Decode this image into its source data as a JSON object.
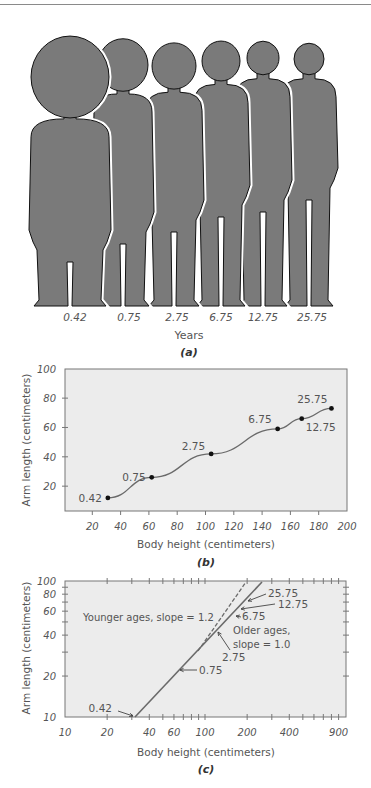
{
  "colors": {
    "silhouette_fill": "#7a7a7a",
    "silhouette_stroke": "#111111",
    "plot_bg": "#ececec",
    "axis": "#777777",
    "line": "#6a6a6a",
    "text": "#555555"
  },
  "panel_a": {
    "caption": "(a)",
    "xlabel": "Years",
    "ages": [
      "0.42",
      "0.75",
      "2.75",
      "6.75",
      "12.75",
      "25.75"
    ]
  },
  "panel_b": {
    "caption": "(b)",
    "xlabel": "Body height (centimeters)",
    "ylabel": "Arm length (centimeters)",
    "xticks": [
      "20",
      "40",
      "60",
      "80",
      "100",
      "120",
      "140",
      "160",
      "180",
      "200"
    ],
    "yticks": [
      "20",
      "40",
      "60",
      "80",
      "100"
    ],
    "point_labels": [
      "0.42",
      "0.75",
      "2.75",
      "6.75",
      "12.75",
      "25.75"
    ]
  },
  "panel_c": {
    "caption": "(c)",
    "xlabel": "Body height (centimeters)",
    "ylabel": "Arm length (centimeters)",
    "xticks": [
      "10",
      "20",
      "40",
      "60",
      "100",
      "200",
      "400",
      "900"
    ],
    "yticks": [
      "10",
      "20",
      "40",
      "60",
      "80",
      "100"
    ],
    "annotation_younger": "Younger ages, slope = 1.2",
    "annotation_older_1": "Older ages,",
    "annotation_older_2": "slope = 1.0",
    "point_labels": [
      "0.42",
      "0.75",
      "2.75",
      "6.75",
      "12.75",
      "25.75"
    ]
  },
  "chart_data": [
    {
      "type": "line",
      "title": "(b)",
      "xlabel": "Body height (centimeters)",
      "ylabel": "Arm length (centimeters)",
      "xlim": [
        0,
        200
      ],
      "ylim": [
        0,
        100
      ],
      "grid": false,
      "series": [
        {
          "name": "Age (years)",
          "labels": [
            "0.42",
            "0.75",
            "2.75",
            "6.75",
            "12.75",
            "25.75"
          ],
          "x": [
            31,
            62,
            104,
            151,
            168,
            189
          ],
          "y": [
            12,
            26,
            42,
            59,
            66,
            73
          ]
        }
      ]
    },
    {
      "type": "line",
      "title": "(c)",
      "xlabel": "Body height (centimeters)",
      "ylabel": "Arm length (centimeters)",
      "xscale": "log",
      "yscale": "log",
      "xlim": [
        10,
        1000
      ],
      "ylim": [
        10,
        100
      ],
      "grid": false,
      "annotations": [
        "Younger ages, slope = 1.2",
        "Older ages, slope = 1.0"
      ],
      "series": [
        {
          "name": "Observed (solid)",
          "labels": [
            "0.42",
            "0.75",
            "2.75",
            "6.75",
            "12.75",
            "25.75"
          ],
          "x": [
            31,
            62,
            104,
            151,
            168,
            189
          ],
          "y": [
            10,
            26,
            42,
            59,
            66,
            73
          ]
        },
        {
          "name": "Younger ages extrapolation, slope = 1.2 (dashed)",
          "x": [
            104,
            215
          ],
          "y": [
            42,
            100
          ]
        }
      ]
    }
  ]
}
